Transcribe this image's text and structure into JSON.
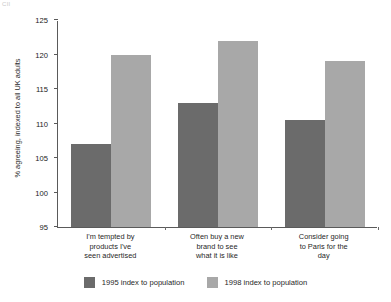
{
  "corner_mark": "CII",
  "chart_data": {
    "type": "bar",
    "title": "",
    "xlabel": "",
    "ylabel": "% agreeing, indexed to all UK adults",
    "ylim": [
      95,
      125
    ],
    "yticks": [
      95,
      100,
      105,
      110,
      115,
      120,
      125
    ],
    "ytick_labels": [
      "95",
      "100",
      "105",
      "110",
      "115",
      "120",
      "125"
    ],
    "grid": false,
    "legend_position": "bottom",
    "categories": [
      "I'm tempted by products I've seen advertised",
      "Often buy a new brand to see what it is like",
      "Consider going to Paris for the day"
    ],
    "category_lines": [
      [
        "I'm tempted by",
        "products I've",
        "seen advertised"
      ],
      [
        "Often buy a new",
        "brand to see",
        "what it is like"
      ],
      [
        "Consider going",
        "to Paris for the",
        "day"
      ]
    ],
    "series": [
      {
        "name": "1995 index to population",
        "color": "#6b6b6b",
        "values": [
          107,
          113,
          110.5
        ]
      },
      {
        "name": "1998 index to population",
        "color": "#a8a8a8",
        "values": [
          120,
          122,
          119
        ]
      }
    ]
  }
}
